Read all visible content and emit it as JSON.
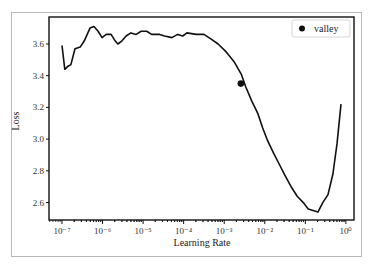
{
  "chart_data": {
    "type": "line",
    "title": "",
    "xlabel": "Learning Rate",
    "ylabel": "Loss",
    "xscale": "log",
    "xlim_log10": [
      -7.32,
      0.2
    ],
    "ylim": [
      2.49,
      3.77
    ],
    "x_ticks": [
      {
        "exp": -7,
        "label": "10⁻⁷"
      },
      {
        "exp": -6,
        "label": "10⁻⁶"
      },
      {
        "exp": -5,
        "label": "10⁻⁵"
      },
      {
        "exp": -4,
        "label": "10⁻⁴"
      },
      {
        "exp": -3,
        "label": "10⁻³"
      },
      {
        "exp": -2,
        "label": "10⁻²"
      },
      {
        "exp": -1,
        "label": "10⁻¹"
      },
      {
        "exp": 0,
        "label": "10⁰"
      }
    ],
    "y_ticks": [
      2.6,
      2.8,
      3.0,
      3.2,
      3.4,
      3.6
    ],
    "y_tick_labels": [
      "2.6",
      "2.8",
      "3.0",
      "3.2",
      "3.4",
      "3.6"
    ],
    "grid": false,
    "legend": {
      "position": "upper right",
      "entries": [
        "valley"
      ]
    },
    "series": [
      {
        "name": "loss",
        "log10_x": [
          -7.0,
          -6.93,
          -6.85,
          -6.78,
          -6.68,
          -6.55,
          -6.45,
          -6.31,
          -6.21,
          -6.11,
          -6.01,
          -5.91,
          -5.79,
          -5.69,
          -5.62,
          -5.52,
          -5.42,
          -5.3,
          -5.17,
          -5.05,
          -4.91,
          -4.79,
          -4.59,
          -4.47,
          -4.29,
          -4.15,
          -4.02,
          -3.92,
          -3.69,
          -3.5,
          -3.32,
          -3.15,
          -2.95,
          -2.76,
          -2.58,
          -2.47,
          -2.32,
          -2.17,
          -2.05,
          -1.93,
          -1.78,
          -1.64,
          -1.5,
          -1.35,
          -1.2,
          -1.05,
          -0.93,
          -0.69,
          -0.57,
          -0.44,
          -0.32,
          -0.22,
          -0.12
        ],
        "y": [
          3.59,
          3.44,
          3.46,
          3.47,
          3.57,
          3.58,
          3.62,
          3.7,
          3.71,
          3.68,
          3.64,
          3.66,
          3.66,
          3.62,
          3.6,
          3.62,
          3.65,
          3.67,
          3.66,
          3.68,
          3.68,
          3.66,
          3.66,
          3.65,
          3.64,
          3.66,
          3.65,
          3.67,
          3.66,
          3.66,
          3.63,
          3.6,
          3.55,
          3.49,
          3.41,
          3.33,
          3.24,
          3.16,
          3.07,
          2.99,
          2.91,
          2.84,
          2.77,
          2.7,
          2.64,
          2.6,
          2.56,
          2.54,
          2.6,
          2.65,
          2.78,
          2.97,
          3.22
        ]
      }
    ],
    "markers": [
      {
        "name": "valley",
        "x": 0.0026,
        "log10_x": -2.59,
        "y": 3.35
      }
    ]
  },
  "legend_label": "valley",
  "colors": {
    "line": "#111111",
    "axis": "#111111",
    "frame": "#b9b9b9",
    "legend_border": "#cccccc"
  }
}
